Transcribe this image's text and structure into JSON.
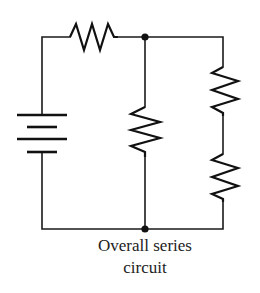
{
  "diagram": {
    "type": "circuit-schematic",
    "caption": {
      "line1": "Overall series",
      "line2": "circuit"
    },
    "components": [
      {
        "id": "battery",
        "kind": "battery",
        "cells": 2
      },
      {
        "id": "r-top",
        "kind": "resistor",
        "position": "top series"
      },
      {
        "id": "r-middle",
        "kind": "resistor",
        "position": "middle parallel branch"
      },
      {
        "id": "r-right-upper",
        "kind": "resistor",
        "position": "right branch upper"
      },
      {
        "id": "r-right-lower",
        "kind": "resistor",
        "position": "right branch lower"
      }
    ],
    "junctions": [
      {
        "id": "junction-top",
        "x": 145,
        "y": 37
      },
      {
        "id": "junction-bottom",
        "x": 145,
        "y": 229
      }
    ],
    "colors": {
      "line": "#111111",
      "background": "#ffffff",
      "text": "#222222"
    }
  }
}
